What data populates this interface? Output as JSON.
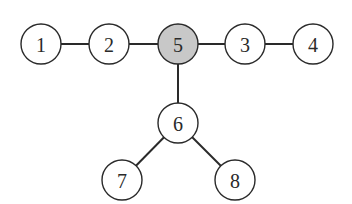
{
  "diagram": {
    "type": "tree-graph",
    "highlight_color": "#c8c8c8",
    "default_fill": "#ffffff",
    "nodes": [
      {
        "id": "1",
        "label": "1",
        "x": 41,
        "y": 44,
        "highlighted": false
      },
      {
        "id": "2",
        "label": "2",
        "x": 109,
        "y": 44,
        "highlighted": false
      },
      {
        "id": "5",
        "label": "5",
        "x": 178,
        "y": 44,
        "highlighted": true
      },
      {
        "id": "3",
        "label": "3",
        "x": 245,
        "y": 44,
        "highlighted": false
      },
      {
        "id": "4",
        "label": "4",
        "x": 313,
        "y": 44,
        "highlighted": false
      },
      {
        "id": "6",
        "label": "6",
        "x": 178,
        "y": 123,
        "highlighted": false
      },
      {
        "id": "7",
        "label": "7",
        "x": 122,
        "y": 180,
        "highlighted": false
      },
      {
        "id": "8",
        "label": "8",
        "x": 235,
        "y": 180,
        "highlighted": false
      }
    ],
    "edges": [
      {
        "from": "1",
        "to": "2"
      },
      {
        "from": "2",
        "to": "5"
      },
      {
        "from": "5",
        "to": "3"
      },
      {
        "from": "3",
        "to": "4"
      },
      {
        "from": "5",
        "to": "6"
      },
      {
        "from": "6",
        "to": "7"
      },
      {
        "from": "6",
        "to": "8"
      }
    ]
  }
}
